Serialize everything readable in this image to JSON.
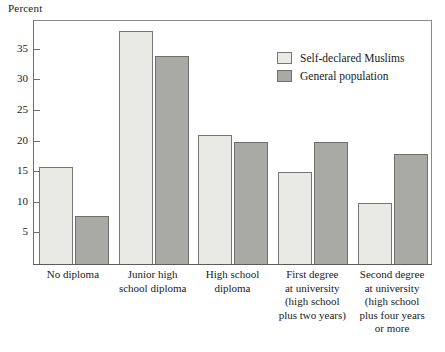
{
  "chart_data": {
    "type": "bar",
    "title": "",
    "xlabel": "",
    "ylabel": "Percent",
    "ylim": [
      0,
      40
    ],
    "yticks": [
      5,
      10,
      15,
      20,
      25,
      30,
      35
    ],
    "grid": false,
    "legend_position": "top-right",
    "categories": [
      "No diploma",
      "Junior high school diploma",
      "High school diploma",
      "First degree at university (high school plus two years)",
      "Second degree at university (high school plus four years or more"
    ],
    "category_lines": [
      [
        "No diploma"
      ],
      [
        "Junior  high",
        "school diploma"
      ],
      [
        "High school",
        "diploma"
      ],
      [
        "First degree",
        "at university",
        "(high school",
        "plus two years)"
      ],
      [
        "Second degree",
        "at university",
        "(high school",
        "plus four years",
        "or more"
      ]
    ],
    "series": [
      {
        "name": "Self-declared Muslims",
        "color": "#e9e9e6",
        "values": [
          15.8,
          38.0,
          21.0,
          15.0,
          10.0
        ]
      },
      {
        "name": "General population",
        "color": "#a9a9a6",
        "values": [
          7.8,
          34.0,
          20.0,
          20.0,
          18.0
        ]
      }
    ]
  },
  "legend": {
    "items": [
      {
        "label": "Self-declared Muslims",
        "swatch": "light"
      },
      {
        "label": "General population",
        "swatch": "dark"
      }
    ]
  },
  "axis": {
    "y_title": "Percent",
    "y_tick_labels": [
      "35",
      "30",
      "25",
      "20",
      "15",
      "10",
      "5"
    ]
  },
  "colors": {
    "light_bar": "#e9e9e6",
    "dark_bar": "#a9a9a6",
    "bar_outline": "#777777",
    "frame": "#8a8a8a",
    "text": "#1a1a1a"
  }
}
